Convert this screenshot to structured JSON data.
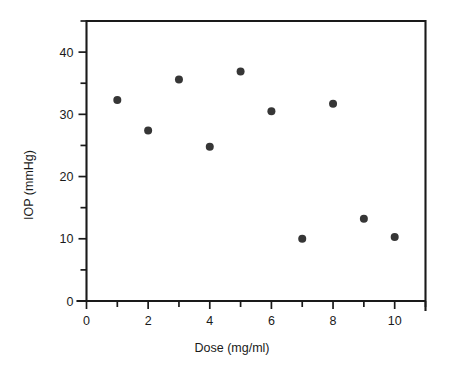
{
  "chart_data": {
    "type": "scatter",
    "title": "",
    "xlabel": "Dose (mg/ml)",
    "ylabel": "IOP (mmHg)",
    "xlim": [
      0,
      11
    ],
    "ylim": [
      0,
      45
    ],
    "grid": false,
    "legend": null,
    "x": [
      1,
      2,
      3,
      4,
      5,
      6,
      7,
      8,
      9,
      10
    ],
    "y": [
      32.3,
      27.4,
      35.6,
      24.8,
      36.9,
      30.5,
      10.0,
      31.7,
      13.2,
      10.3
    ],
    "points": [
      {
        "x": 1,
        "y": 32.3
      },
      {
        "x": 2,
        "y": 27.4
      },
      {
        "x": 3,
        "y": 35.6
      },
      {
        "x": 4,
        "y": 24.8
      },
      {
        "x": 5,
        "y": 36.9
      },
      {
        "x": 6,
        "y": 30.5
      },
      {
        "x": 7,
        "y": 10.0
      },
      {
        "x": 8,
        "y": 31.7
      },
      {
        "x": 9,
        "y": 13.2
      },
      {
        "x": 10,
        "y": 10.3
      }
    ],
    "marker": "filled-circle",
    "marker_color": "#363636",
    "marker_size": 8,
    "axis_color": "#1a1a1a",
    "background_color": "#ffffff",
    "xticks_major": [
      0,
      2,
      4,
      6,
      8,
      10
    ],
    "xticks_major_labels": [
      "0",
      "2",
      "4",
      "6",
      "8",
      "10"
    ],
    "xticks_minor": [
      1,
      3,
      5,
      7,
      9,
      11
    ],
    "yticks_major": [
      0,
      10,
      20,
      30,
      40
    ],
    "yticks_major_labels": [
      "0",
      "10",
      "20",
      "30",
      "40"
    ],
    "yticks_minor": [
      5,
      15,
      25,
      35,
      45
    ]
  }
}
